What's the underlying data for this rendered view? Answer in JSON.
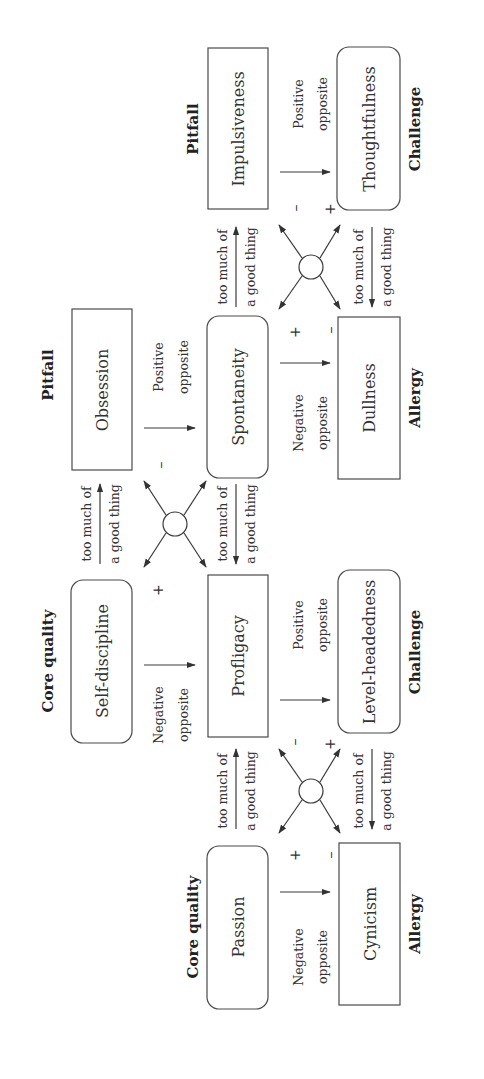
{
  "diagram": {
    "rotation_deg": -90,
    "colors": {
      "line": "#3a3a3a",
      "text": "#333333",
      "background": "#ffffff"
    },
    "headers": {
      "core_quality_1": "Core quality",
      "allergy_1": "Allergy",
      "core_quality_2": "Core quality",
      "challenge_1": "Challenge",
      "pitfall_1": "Pitfall",
      "allergy_2": "Allergy",
      "pitfall_2": "Pitfall",
      "challenge_2": "Challenge"
    },
    "boxes": {
      "passion": "Passion",
      "cynicism": "Cynicism",
      "self_discipline": "Self-discipline",
      "profligacy": "Profligacy",
      "level_headedness": "Level-headedness",
      "obsession": "Obsession",
      "spontaneity": "Spontaneity",
      "dullness": "Dullness",
      "impulsiveness": "Impulsiveness",
      "thoughtfulness": "Thoughtfulness"
    },
    "labels": {
      "negative": "Negative",
      "positive": "Positive",
      "opposite": "opposite",
      "too_much_of": "too much of",
      "a_good_thing": "a good thing"
    },
    "signs": {
      "plus": "+",
      "minus": "–"
    },
    "nodes": [
      {
        "id": "passion",
        "role": "Core quality",
        "shape": "rounded"
      },
      {
        "id": "cynicism",
        "role": "Allergy",
        "shape": "rect"
      },
      {
        "id": "self_discipline",
        "role": "Core quality",
        "shape": "rounded"
      },
      {
        "id": "profligacy",
        "role": "Pitfall/Allergy",
        "shape": "rect"
      },
      {
        "id": "level_headedness",
        "role": "Challenge",
        "shape": "rounded"
      },
      {
        "id": "obsession",
        "role": "Pitfall",
        "shape": "rect"
      },
      {
        "id": "spontaneity",
        "role": "Challenge/Core quality",
        "shape": "rounded"
      },
      {
        "id": "dullness",
        "role": "Allergy",
        "shape": "rect"
      },
      {
        "id": "impulsiveness",
        "role": "Pitfall",
        "shape": "rect"
      },
      {
        "id": "thoughtfulness",
        "role": "Challenge",
        "shape": "rounded"
      }
    ],
    "edges": [
      {
        "from": "passion",
        "to": "cynicism",
        "label": "Negative opposite"
      },
      {
        "from": "passion",
        "to": "profligacy",
        "label": "too much of a good thing"
      },
      {
        "from": "level_headedness",
        "to": "cynicism",
        "label": "too much of a good thing"
      },
      {
        "from": "profligacy",
        "to": "level_headedness",
        "label": "Positive opposite"
      },
      {
        "from": "self_discipline",
        "to": "profligacy",
        "label": "Negative opposite"
      },
      {
        "from": "self_discipline",
        "to": "obsession",
        "label": "too much of a good thing"
      },
      {
        "from": "spontaneity",
        "to": "profligacy",
        "label": "too much of a good thing"
      },
      {
        "from": "obsession",
        "to": "spontaneity",
        "label": "Positive opposite"
      },
      {
        "from": "spontaneity",
        "to": "dullness",
        "label": "Negative opposite"
      },
      {
        "from": "spontaneity",
        "to": "impulsiveness",
        "label": "too much of a good thing"
      },
      {
        "from": "thoughtfulness",
        "to": "dullness",
        "label": "too much of a good thing"
      },
      {
        "from": "impulsiveness",
        "to": "thoughtfulness",
        "label": "Positive opposite"
      }
    ]
  }
}
